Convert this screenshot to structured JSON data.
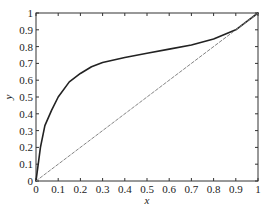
{
  "chart_data": {
    "type": "line",
    "title": "",
    "xlabel": "x",
    "ylabel": "y",
    "xlim": [
      0,
      1
    ],
    "ylim": [
      0,
      1
    ],
    "grid": false,
    "legend": null,
    "x_ticks": [
      "0",
      "0.1",
      "0.2",
      "0.3",
      "0.4",
      "0.5",
      "0.6",
      "0.7",
      "0.8",
      "0.9",
      "1"
    ],
    "y_ticks": [
      "0",
      "0.1",
      "0.2",
      "0.3",
      "0.4",
      "0.5",
      "0.6",
      "0.7",
      "0.8",
      "0.9",
      "1"
    ],
    "series": [
      {
        "name": "equilibrium curve",
        "style": "solid",
        "color": "#222222",
        "x": [
          0,
          0.02,
          0.04,
          0.07,
          0.1,
          0.15,
          0.2,
          0.25,
          0.3,
          0.4,
          0.5,
          0.6,
          0.7,
          0.8,
          0.9,
          0.95,
          1
        ],
        "y": [
          0,
          0.2,
          0.33,
          0.42,
          0.5,
          0.59,
          0.64,
          0.68,
          0.705,
          0.735,
          0.76,
          0.785,
          0.81,
          0.845,
          0.9,
          0.95,
          1
        ]
      },
      {
        "name": "diagonal y=x",
        "style": "dashed",
        "color": "#777777",
        "x": [
          0,
          1
        ],
        "y": [
          0,
          1
        ]
      }
    ]
  }
}
